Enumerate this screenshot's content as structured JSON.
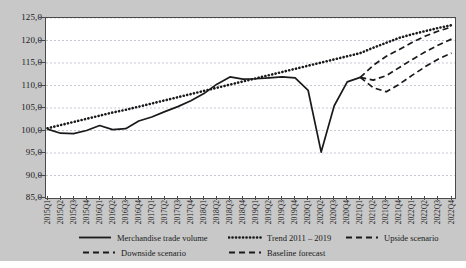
{
  "chart_data": {
    "type": "line",
    "title": "",
    "xlabel": "",
    "ylabel": "",
    "ylim": [
      85.0,
      125.0
    ],
    "ytick_step": 5.0,
    "grid": true,
    "legend_position": "bottom",
    "ytick_labels": [
      "125,0",
      "120,0",
      "115,0",
      "110,0",
      "105,0",
      "100,0",
      "95,0",
      "90,0",
      "85,0"
    ],
    "ytick_values": [
      125.0,
      120.0,
      115.0,
      110.0,
      105.0,
      100.0,
      95.0,
      90.0,
      85.0
    ],
    "categories": [
      "2015Q1",
      "2015Q2",
      "2015Q3",
      "2015Q4",
      "2016Q1",
      "2016Q2",
      "2016Q3",
      "2016Q4",
      "2017Q1",
      "2017Q2",
      "2017Q3",
      "2017Q4",
      "2018Q1",
      "2018Q2",
      "2018Q3",
      "2018Q4",
      "2019Q1",
      "2019Q2",
      "2019Q3",
      "2019Q4",
      "2020Q1",
      "2020Q2",
      "2020Q3",
      "2020Q4",
      "2021Q1",
      "2021Q2",
      "2021Q3",
      "2021Q4",
      "2022Q1",
      "2022Q2",
      "2022Q3",
      "2022Q4"
    ],
    "series": [
      {
        "name": "Merchandise trade volume",
        "style": "solid",
        "color": "#1a1a1a",
        "values": [
          100.3,
          99.4,
          99.3,
          100.0,
          101.1,
          100.2,
          100.4,
          102.1,
          103.0,
          104.2,
          105.3,
          106.6,
          108.2,
          110.3,
          111.9,
          111.4,
          111.5,
          111.7,
          111.9,
          111.7,
          108.9,
          95.2,
          105.5,
          110.8,
          111.8,
          null,
          null,
          null,
          null,
          null,
          null,
          null
        ]
      },
      {
        "name": "Trend 2011 – 2019",
        "style": "dotted",
        "color": "#1a1a1a",
        "values": [
          100.5,
          101.2,
          101.9,
          102.6,
          103.3,
          104.0,
          104.6,
          105.3,
          106.0,
          106.7,
          107.4,
          108.1,
          108.8,
          109.5,
          110.2,
          110.9,
          111.6,
          112.3,
          113.0,
          113.7,
          114.4,
          115.1,
          115.8,
          116.5,
          117.2,
          118.4,
          119.5,
          120.6,
          121.4,
          122.1,
          122.8,
          123.4
        ]
      },
      {
        "name": "Upside scenario",
        "style": "dashed",
        "color": "#1a1a1a",
        "values": [
          null,
          null,
          null,
          null,
          null,
          null,
          null,
          null,
          null,
          null,
          null,
          null,
          null,
          null,
          null,
          null,
          null,
          null,
          null,
          null,
          null,
          null,
          null,
          null,
          111.8,
          114.5,
          116.5,
          118.0,
          119.6,
          121.0,
          122.1,
          123.0
        ]
      },
      {
        "name": "Baseline forecast",
        "style": "dashed",
        "color": "#1a1a1a",
        "values": [
          null,
          null,
          null,
          null,
          null,
          null,
          null,
          null,
          null,
          null,
          null,
          null,
          null,
          null,
          null,
          null,
          null,
          null,
          null,
          null,
          null,
          null,
          null,
          null,
          111.8,
          111.2,
          112.2,
          114.0,
          115.8,
          117.5,
          119.0,
          120.3
        ]
      },
      {
        "name": "Downside scenario",
        "style": "dashed",
        "color": "#1a1a1a",
        "values": [
          null,
          null,
          null,
          null,
          null,
          null,
          null,
          null,
          null,
          null,
          null,
          null,
          null,
          null,
          null,
          null,
          null,
          null,
          null,
          null,
          null,
          null,
          null,
          null,
          111.8,
          109.5,
          108.6,
          110.3,
          112.3,
          114.2,
          115.9,
          117.2
        ]
      }
    ],
    "legend": [
      {
        "label": "Merchandise trade volume",
        "style": "solid"
      },
      {
        "label": "Trend 2011 – 2019",
        "style": "dotted"
      },
      {
        "label": "Upside scenario",
        "style": "dashed"
      },
      {
        "label": "Downside scenario",
        "style": "dashed"
      },
      {
        "label": "Baseline forecast",
        "style": "dashed"
      }
    ]
  }
}
